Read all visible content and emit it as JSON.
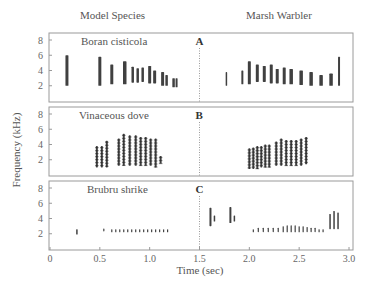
{
  "figure": {
    "left_header": "Model Species",
    "right_header": "Marsh Warbler",
    "ylabel": "Frequency (kHz)",
    "xlabel": "Time (sec)"
  },
  "chart_data": {
    "type": "heatmap",
    "title": "",
    "xlabel": "Time (sec)",
    "ylabel": "Frequency (kHz)",
    "xlim": [
      0,
      3.0
    ],
    "ylim": [
      0,
      8
    ],
    "x_ticks": [
      "0",
      "0.5",
      "1.0",
      "1.5",
      "2.0",
      "2.5",
      "3.0"
    ],
    "y_ticks": [
      "2",
      "4",
      "6",
      "8"
    ],
    "divider_time": 1.5,
    "column_headers": [
      "Model Species",
      "Marsh Warbler"
    ],
    "panels": [
      {
        "letter": "A",
        "title": "Boran cisticola",
        "model_notes": [
          {
            "t": 0.17,
            "fmin": 2.0,
            "fmax": 6.0,
            "w": 0.03
          },
          {
            "t": 0.5,
            "fmin": 2.0,
            "fmax": 5.8,
            "w": 0.03
          },
          {
            "t": 0.62,
            "fmin": 2.2,
            "fmax": 4.8,
            "w": 0.03
          },
          {
            "t": 0.75,
            "fmin": 2.2,
            "fmax": 5.2,
            "w": 0.035
          },
          {
            "t": 0.83,
            "fmin": 2.4,
            "fmax": 4.5,
            "w": 0.025
          },
          {
            "t": 0.88,
            "fmin": 2.4,
            "fmax": 4.3,
            "w": 0.025
          },
          {
            "t": 0.93,
            "fmin": 2.5,
            "fmax": 4.4,
            "w": 0.025
          },
          {
            "t": 1.0,
            "fmin": 2.3,
            "fmax": 4.6,
            "w": 0.03
          },
          {
            "t": 1.05,
            "fmin": 2.3,
            "fmax": 4.0,
            "w": 0.03
          },
          {
            "t": 1.13,
            "fmin": 2.0,
            "fmax": 3.8,
            "w": 0.03
          },
          {
            "t": 1.17,
            "fmin": 2.0,
            "fmax": 3.4,
            "w": 0.025
          },
          {
            "t": 1.24,
            "fmin": 1.8,
            "fmax": 3.0,
            "w": 0.025
          },
          {
            "t": 1.27,
            "fmin": 1.8,
            "fmax": 3.0,
            "w": 0.02
          }
        ],
        "mimic_notes": [
          {
            "t": 1.77,
            "fmin": 2.0,
            "fmax": 3.8,
            "w": 0.015
          },
          {
            "t": 1.93,
            "fmin": 2.2,
            "fmax": 4.0,
            "w": 0.02
          },
          {
            "t": 2.0,
            "fmin": 2.2,
            "fmax": 5.2,
            "w": 0.03
          },
          {
            "t": 2.08,
            "fmin": 2.5,
            "fmax": 4.8,
            "w": 0.03
          },
          {
            "t": 2.15,
            "fmin": 2.5,
            "fmax": 4.6,
            "w": 0.03
          },
          {
            "t": 2.22,
            "fmin": 2.3,
            "fmax": 4.8,
            "w": 0.03
          },
          {
            "t": 2.28,
            "fmin": 2.3,
            "fmax": 4.2,
            "w": 0.03
          },
          {
            "t": 2.35,
            "fmin": 2.2,
            "fmax": 4.4,
            "w": 0.03
          },
          {
            "t": 2.42,
            "fmin": 2.2,
            "fmax": 4.2,
            "w": 0.035
          },
          {
            "t": 2.52,
            "fmin": 2.1,
            "fmax": 4.0,
            "w": 0.035
          },
          {
            "t": 2.62,
            "fmin": 2.0,
            "fmax": 3.8,
            "w": 0.035
          },
          {
            "t": 2.72,
            "fmin": 2.0,
            "fmax": 3.4,
            "w": 0.035
          },
          {
            "t": 2.82,
            "fmin": 2.0,
            "fmax": 3.6,
            "w": 0.035
          },
          {
            "t": 2.9,
            "fmin": 2.0,
            "fmax": 5.8,
            "w": 0.02
          }
        ]
      },
      {
        "letter": "B",
        "title": "Vinaceous dove",
        "model_notes": [
          {
            "t": 0.47,
            "fmin": 1.0,
            "fmax": 3.8,
            "w": 0.02
          },
          {
            "t": 0.52,
            "fmin": 1.0,
            "fmax": 3.8,
            "w": 0.02
          },
          {
            "t": 0.57,
            "fmin": 1.0,
            "fmax": 4.5,
            "w": 0.02
          },
          {
            "t": 0.69,
            "fmin": 1.2,
            "fmax": 4.8,
            "w": 0.02
          },
          {
            "t": 0.74,
            "fmin": 1.2,
            "fmax": 5.4,
            "w": 0.02
          },
          {
            "t": 0.8,
            "fmin": 1.2,
            "fmax": 5.2,
            "w": 0.02
          },
          {
            "t": 0.86,
            "fmin": 1.2,
            "fmax": 5.2,
            "w": 0.02
          },
          {
            "t": 0.91,
            "fmin": 1.2,
            "fmax": 5.0,
            "w": 0.02
          },
          {
            "t": 0.96,
            "fmin": 1.2,
            "fmax": 5.0,
            "w": 0.02
          },
          {
            "t": 1.01,
            "fmin": 1.2,
            "fmax": 4.8,
            "w": 0.02
          },
          {
            "t": 1.06,
            "fmin": 1.0,
            "fmax": 4.8,
            "w": 0.02
          },
          {
            "t": 1.11,
            "fmin": 1.5,
            "fmax": 2.5,
            "w": 0.02
          }
        ],
        "mimic_notes": [
          {
            "t": 2.0,
            "fmin": 0.8,
            "fmax": 3.5,
            "w": 0.02
          },
          {
            "t": 2.04,
            "fmin": 0.8,
            "fmax": 3.6,
            "w": 0.02
          },
          {
            "t": 2.08,
            "fmin": 0.8,
            "fmax": 3.8,
            "w": 0.02
          },
          {
            "t": 2.12,
            "fmin": 1.0,
            "fmax": 3.8,
            "w": 0.02
          },
          {
            "t": 2.16,
            "fmin": 1.0,
            "fmax": 4.0,
            "w": 0.02
          },
          {
            "t": 2.2,
            "fmin": 1.0,
            "fmax": 4.0,
            "w": 0.02
          },
          {
            "t": 2.27,
            "fmin": 1.2,
            "fmax": 4.4,
            "w": 0.02
          },
          {
            "t": 2.32,
            "fmin": 1.2,
            "fmax": 4.8,
            "w": 0.02
          },
          {
            "t": 2.37,
            "fmin": 1.2,
            "fmax": 4.6,
            "w": 0.02
          },
          {
            "t": 2.42,
            "fmin": 1.2,
            "fmax": 4.6,
            "w": 0.02
          },
          {
            "t": 2.47,
            "fmin": 1.2,
            "fmax": 4.6,
            "w": 0.02
          },
          {
            "t": 2.52,
            "fmin": 1.2,
            "fmax": 4.8,
            "w": 0.02
          },
          {
            "t": 2.57,
            "fmin": 1.4,
            "fmax": 5.0,
            "w": 0.02
          }
        ]
      },
      {
        "letter": "C",
        "title": "Brubru shrike",
        "model_notes": [
          {
            "t": 0.27,
            "fmin": 1.9,
            "fmax": 2.6,
            "w": 0.015
          },
          {
            "t": 0.54,
            "fmin": 2.3,
            "fmax": 2.7,
            "w": 0.012
          },
          {
            "t": 0.62,
            "fmin": 2.2,
            "fmax": 2.6,
            "w": 0.012
          },
          {
            "t": 0.66,
            "fmin": 2.2,
            "fmax": 2.6,
            "w": 0.012
          },
          {
            "t": 0.7,
            "fmin": 2.2,
            "fmax": 2.6,
            "w": 0.012
          },
          {
            "t": 0.74,
            "fmin": 2.2,
            "fmax": 2.6,
            "w": 0.012
          },
          {
            "t": 0.78,
            "fmin": 2.2,
            "fmax": 2.6,
            "w": 0.012
          },
          {
            "t": 0.82,
            "fmin": 2.2,
            "fmax": 2.6,
            "w": 0.012
          },
          {
            "t": 0.86,
            "fmin": 2.2,
            "fmax": 2.6,
            "w": 0.012
          },
          {
            "t": 0.9,
            "fmin": 2.2,
            "fmax": 2.6,
            "w": 0.012
          },
          {
            "t": 0.94,
            "fmin": 2.2,
            "fmax": 2.6,
            "w": 0.012
          },
          {
            "t": 0.98,
            "fmin": 2.2,
            "fmax": 2.6,
            "w": 0.012
          },
          {
            "t": 1.02,
            "fmin": 2.2,
            "fmax": 2.6,
            "w": 0.012
          },
          {
            "t": 1.06,
            "fmin": 2.2,
            "fmax": 2.6,
            "w": 0.012
          },
          {
            "t": 1.1,
            "fmin": 2.2,
            "fmax": 2.6,
            "w": 0.012
          },
          {
            "t": 1.14,
            "fmin": 2.2,
            "fmax": 2.6,
            "w": 0.012
          },
          {
            "t": 1.18,
            "fmin": 2.2,
            "fmax": 2.6,
            "w": 0.012
          }
        ],
        "mimic_notes": [
          {
            "t": 1.61,
            "fmin": 3.0,
            "fmax": 5.4,
            "w": 0.02
          },
          {
            "t": 1.65,
            "fmin": 3.6,
            "fmax": 4.4,
            "w": 0.015
          },
          {
            "t": 1.81,
            "fmin": 3.4,
            "fmax": 5.5,
            "w": 0.02
          },
          {
            "t": 1.85,
            "fmin": 3.6,
            "fmax": 4.4,
            "w": 0.015
          },
          {
            "t": 2.04,
            "fmin": 2.2,
            "fmax": 2.6,
            "w": 0.012
          },
          {
            "t": 2.09,
            "fmin": 2.2,
            "fmax": 2.8,
            "w": 0.012
          },
          {
            "t": 2.14,
            "fmin": 2.2,
            "fmax": 2.8,
            "w": 0.012
          },
          {
            "t": 2.19,
            "fmin": 2.2,
            "fmax": 2.8,
            "w": 0.012
          },
          {
            "t": 2.24,
            "fmin": 2.2,
            "fmax": 2.8,
            "w": 0.012
          },
          {
            "t": 2.29,
            "fmin": 2.2,
            "fmax": 2.8,
            "w": 0.012
          },
          {
            "t": 2.34,
            "fmin": 2.2,
            "fmax": 3.0,
            "w": 0.012
          },
          {
            "t": 2.38,
            "fmin": 2.2,
            "fmax": 3.1,
            "w": 0.012
          },
          {
            "t": 2.42,
            "fmin": 2.2,
            "fmax": 3.1,
            "w": 0.012
          },
          {
            "t": 2.46,
            "fmin": 2.2,
            "fmax": 3.1,
            "w": 0.012
          },
          {
            "t": 2.5,
            "fmin": 2.2,
            "fmax": 3.0,
            "w": 0.012
          },
          {
            "t": 2.54,
            "fmin": 2.2,
            "fmax": 3.0,
            "w": 0.012
          },
          {
            "t": 2.58,
            "fmin": 2.2,
            "fmax": 2.9,
            "w": 0.012
          },
          {
            "t": 2.62,
            "fmin": 2.2,
            "fmax": 2.8,
            "w": 0.012
          },
          {
            "t": 2.66,
            "fmin": 2.2,
            "fmax": 2.8,
            "w": 0.012
          },
          {
            "t": 2.7,
            "fmin": 2.2,
            "fmax": 2.6,
            "w": 0.012
          },
          {
            "t": 2.74,
            "fmin": 2.2,
            "fmax": 2.6,
            "w": 0.012
          },
          {
            "t": 2.81,
            "fmin": 2.6,
            "fmax": 4.6,
            "w": 0.015
          },
          {
            "t": 2.85,
            "fmin": 2.6,
            "fmax": 5.0,
            "w": 0.015
          },
          {
            "t": 2.89,
            "fmin": 2.6,
            "fmax": 4.8,
            "w": 0.015
          }
        ]
      }
    ]
  },
  "style": {
    "ink": "#1e1e1e",
    "axis": "#9a9a9a",
    "divider": "#9a9a9a"
  }
}
